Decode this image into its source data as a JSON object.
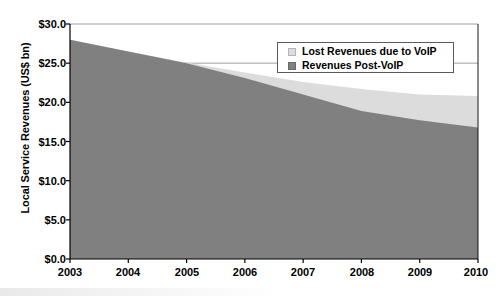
{
  "chart_data": {
    "type": "area",
    "title": "",
    "xlabel": "",
    "ylabel": "Local Service Revenues (US$ bn)",
    "stacked": true,
    "grid": true,
    "legend_position": "top-right",
    "x": [
      2003,
      2004,
      2005,
      2006,
      2007,
      2008,
      2009,
      2010
    ],
    "categories": [
      "2003",
      "2004",
      "2005",
      "2006",
      "2007",
      "2008",
      "2009",
      "2010"
    ],
    "xtick_labels": [
      "2003",
      "2004",
      "2005",
      "2006",
      "2007",
      "2008",
      "2009",
      "2010"
    ],
    "ytick_labels": [
      "$0.0",
      "$5.0",
      "$10.0",
      "$15.0",
      "$20.0",
      "$25.0",
      "$30.0"
    ],
    "ytick_values": [
      0.0,
      5.0,
      10.0,
      15.0,
      20.0,
      25.0,
      30.0
    ],
    "ylim": [
      0.0,
      30.0
    ],
    "xlim": [
      2003,
      2010
    ],
    "series": [
      {
        "name": "Revenues Post-VoIP",
        "color": "#808080",
        "values": [
          28.0,
          26.5,
          25.0,
          23.1,
          21.0,
          18.9,
          17.7,
          16.8
        ]
      },
      {
        "name": "Lost Revenues due to VoIP",
        "color": "#dcdcdc",
        "values": [
          0.0,
          0.0,
          0.1,
          0.7,
          1.6,
          2.8,
          3.3,
          4.0
        ]
      }
    ],
    "totals": [
      28.0,
      26.5,
      25.1,
      23.8,
      22.6,
      21.7,
      21.0,
      20.8
    ]
  },
  "legend": {
    "items": [
      {
        "label": "Lost Revenues due to VoIP",
        "color": "#dcdcdc"
      },
      {
        "label": "Revenues Post-VoIP",
        "color": "#808080"
      }
    ]
  },
  "axes": {
    "y_title": "Local Service Revenues (US$ bn)"
  },
  "colors": {
    "lost_revenues": "#dcdcdc",
    "post_voip": "#808080",
    "axis": "#000000",
    "grid": "#888888",
    "background": "#ffffff"
  }
}
